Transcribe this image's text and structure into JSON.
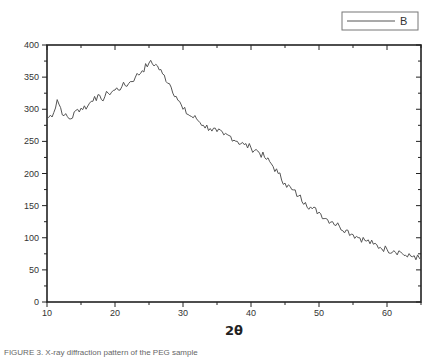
{
  "chart_data": {
    "type": "line",
    "title": "",
    "xlabel": "2θ",
    "ylabel": "",
    "xlim": [
      10,
      65
    ],
    "ylim": [
      0,
      400
    ],
    "x_ticks": [
      10,
      20,
      30,
      40,
      50,
      60
    ],
    "y_ticks": [
      0,
      50,
      100,
      150,
      200,
      250,
      300,
      350,
      400
    ],
    "grid": false,
    "legend_position": "top-right",
    "series": [
      {
        "name": "B",
        "color": "#555555",
        "x": [
          10,
          11,
          11.5,
          12.5,
          13.5,
          14.5,
          16,
          17,
          18,
          19,
          20,
          21,
          22,
          23,
          24,
          25,
          26,
          27,
          28,
          29,
          30,
          31,
          32,
          33,
          34,
          35,
          36,
          37,
          38,
          39,
          40,
          41,
          42,
          43,
          44,
          45,
          46,
          47,
          48,
          49,
          50,
          51,
          52,
          53,
          54,
          55,
          56,
          57,
          58,
          59,
          60,
          61,
          62,
          63,
          64,
          65
        ],
        "values": [
          285,
          295,
          315,
          290,
          285,
          300,
          305,
          320,
          315,
          325,
          330,
          335,
          340,
          350,
          360,
          372,
          370,
          355,
          340,
          320,
          300,
          290,
          285,
          275,
          270,
          265,
          260,
          258,
          250,
          245,
          240,
          235,
          225,
          215,
          200,
          185,
          175,
          165,
          155,
          145,
          140,
          130,
          125,
          118,
          112,
          105,
          100,
          95,
          90,
          85,
          82,
          80,
          78,
          70,
          72,
          65
        ]
      }
    ]
  },
  "legend": {
    "label": "B"
  },
  "axis": {
    "xlabel": "2θ"
  },
  "caption": "FIGURE 3. X-ray diffraction pattern of the PEG sample"
}
